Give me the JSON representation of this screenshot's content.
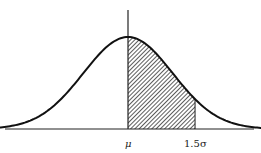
{
  "chart_data": {
    "type": "area",
    "title": "",
    "xlabel": "",
    "ylabel": "",
    "x_ticks": [
      {
        "label": "μ",
        "value": 0
      },
      {
        "label": "1.5σ",
        "value": 1.5
      }
    ],
    "xlim": [
      -3.3,
      3.3
    ],
    "shaded_region": {
      "from": 0,
      "to": 1.5,
      "pattern": "diagonal-hatch"
    },
    "series": [
      {
        "name": "normal-pdf",
        "mean": 0,
        "sd": 1
      }
    ],
    "grid": false,
    "legend": null
  },
  "labels": {
    "mean": "μ",
    "bound": "1.5σ"
  },
  "colors": {
    "curve": "#111111",
    "axis": "#222222",
    "hatch": "#333333",
    "hatch_bg": "#ffffff"
  }
}
